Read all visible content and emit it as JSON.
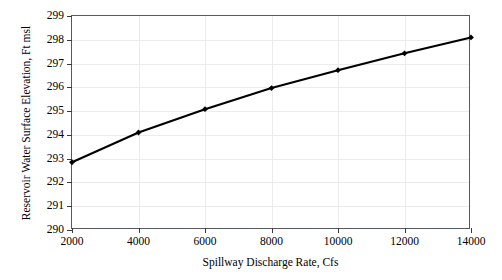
{
  "chart_data": {
    "type": "line",
    "title": "",
    "xlabel": "Spillway Discharge Rate, Cfs",
    "ylabel": "Reservoir Water Surface Elevation, Ft msl",
    "x": [
      2000,
      4000,
      6000,
      8000,
      10000,
      12000,
      14000
    ],
    "values": [
      292.85,
      294.1,
      295.08,
      295.97,
      296.72,
      297.43,
      298.1
    ],
    "series": [
      {
        "name": "Reservoir Water Surface Elevation",
        "x": [
          2000,
          4000,
          6000,
          8000,
          10000,
          12000,
          14000
        ],
        "values": [
          292.85,
          294.1,
          295.08,
          295.97,
          296.72,
          297.43,
          298.1
        ]
      }
    ],
    "xlim": [
      2000,
      14000
    ],
    "ylim": [
      290,
      299
    ],
    "xticks": [
      2000,
      4000,
      6000,
      8000,
      10000,
      12000,
      14000
    ],
    "xtick_labels": [
      "2000",
      "4000",
      "6000",
      "8000",
      "10000",
      "12000",
      "14000"
    ],
    "yticks": [
      290,
      291,
      292,
      293,
      294,
      295,
      296,
      297,
      298,
      299
    ],
    "ytick_labels": [
      "290",
      "291",
      "292",
      "293",
      "294",
      "295",
      "296",
      "297",
      "298",
      "299"
    ],
    "grid": true,
    "legend": "none",
    "marker": "diamond",
    "line_color": "#000000",
    "grid_color": "#ececec",
    "axis_color": "#555a5e",
    "background_color": "#ffffff"
  }
}
